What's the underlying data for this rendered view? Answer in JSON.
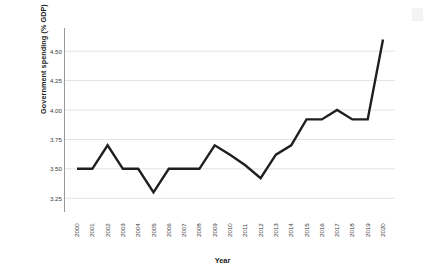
{
  "chart_data": {
    "type": "line",
    "title": "",
    "subtitle": "",
    "xlabel": "Year",
    "ylabel": "Government spending (% GDP)",
    "categories": [
      "2000",
      "2001",
      "2002",
      "2003",
      "2004",
      "2005",
      "2006",
      "2007",
      "2008",
      "2009",
      "2010",
      "2011",
      "2012",
      "2013",
      "2014",
      "2015",
      "2016",
      "2017",
      "2018",
      "2019",
      "2020"
    ],
    "values": [
      3.5,
      3.5,
      3.7,
      3.5,
      3.5,
      3.3,
      3.5,
      3.5,
      3.5,
      3.7,
      3.62,
      3.53,
      3.42,
      3.62,
      3.7,
      3.92,
      3.92,
      4.0,
      3.92,
      3.92,
      4.6
    ],
    "yticks": [
      "3.25",
      "3.50",
      "3.75",
      "4.00",
      "4.25",
      "4.50"
    ],
    "ytick_values": [
      3.25,
      3.5,
      3.75,
      4.0,
      4.25,
      4.5
    ],
    "ylim": [
      3.15,
      4.68
    ],
    "xlim": [
      2000,
      2020
    ],
    "grid": "horizontal",
    "legend": "none",
    "series_color": "#1f1f1f",
    "grid_color": "#e3e3e3",
    "axis_color": "#9a9a9a",
    "background": "#ffffff"
  }
}
